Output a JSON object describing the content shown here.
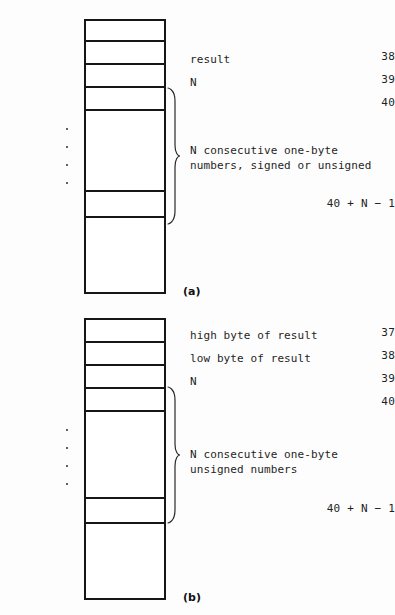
{
  "figure": {
    "background_color": "#fdfdfd",
    "line_color": "#161616",
    "text_color": "#1f1f1f"
  },
  "panels": [
    {
      "id": "a",
      "caption": "(a)",
      "addresses": [
        {
          "label": "38",
          "y": 51
        },
        {
          "label": "39",
          "y": 74
        },
        {
          "label": "40",
          "y": 97
        },
        {
          "label": "40 + N − 1",
          "y": 198
        }
      ],
      "ellipsis_count": 4,
      "notes": [
        {
          "text": "result",
          "y": 52
        },
        {
          "text": "N",
          "y": 75
        },
        {
          "text": "N consecutive one-byte",
          "y": 143
        },
        {
          "text": "numbers, signed or unsigned",
          "y": 158
        }
      ],
      "brace_label": "N consecutive one-byte numbers, signed or unsigned"
    },
    {
      "id": "b",
      "caption": "(b)",
      "addresses": [
        {
          "label": "37",
          "y": 327
        },
        {
          "label": "38",
          "y": 350
        },
        {
          "label": "39",
          "y": 373
        },
        {
          "label": "40",
          "y": 396
        },
        {
          "label": "40 + N − 1",
          "y": 503
        }
      ],
      "ellipsis_count": 4,
      "notes": [
        {
          "text": "high byte of result",
          "y": 328
        },
        {
          "text": "low byte of result",
          "y": 351
        },
        {
          "text": "N",
          "y": 374
        },
        {
          "text": "N consecutive one-byte",
          "y": 447
        },
        {
          "text": "unsigned numbers",
          "y": 462
        }
      ],
      "brace_label": "N consecutive one-byte unsigned numbers"
    }
  ]
}
